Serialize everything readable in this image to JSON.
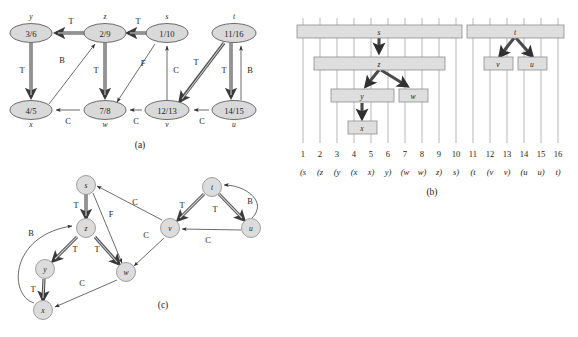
{
  "figure": {
    "captions": {
      "a": "(a)",
      "b": "(b)",
      "c": "(c)"
    }
  },
  "panel_a": {
    "caption": "(a)",
    "nodes": [
      {
        "name": "y",
        "times": "3/6",
        "label_pos": "above",
        "cx": 31,
        "cy": 33
      },
      {
        "name": "z",
        "times": "2/9",
        "label_pos": "above",
        "cx": 105,
        "cy": 33
      },
      {
        "name": "s",
        "times": "1/10",
        "label_pos": "above",
        "cx": 167,
        "cy": 33
      },
      {
        "name": "t",
        "times": "11/16",
        "label_pos": "above",
        "cx": 234,
        "cy": 33
      },
      {
        "name": "x",
        "times": "4/5",
        "label_pos": "below",
        "cx": 31,
        "cy": 110
      },
      {
        "name": "w",
        "times": "7/8",
        "label_pos": "below",
        "cx": 105,
        "cy": 110
      },
      {
        "name": "v",
        "times": "12/13",
        "label_pos": "below",
        "cx": 167,
        "cy": 110
      },
      {
        "name": "u",
        "times": "14/15",
        "label_pos": "below",
        "cx": 234,
        "cy": 110
      }
    ],
    "edges": [
      {
        "from": "z",
        "to": "y",
        "class": "T",
        "kind": "tree"
      },
      {
        "from": "s",
        "to": "z",
        "class": "T",
        "kind": "tree"
      },
      {
        "from": "y",
        "to": "x",
        "class": "T",
        "kind": "tree"
      },
      {
        "from": "z",
        "to": "w",
        "class": "T",
        "kind": "tree"
      },
      {
        "from": "x",
        "to": "z",
        "class": "B",
        "kind": "thin"
      },
      {
        "from": "s",
        "to": "w",
        "class": "F",
        "kind": "thin"
      },
      {
        "from": "v",
        "to": "s",
        "class": "C",
        "kind": "thin"
      },
      {
        "from": "t",
        "to": "v",
        "class": "T",
        "kind": "tree"
      },
      {
        "from": "t",
        "to": "u",
        "class": "T",
        "kind": "tree"
      },
      {
        "from": "u",
        "to": "t",
        "class": "B",
        "kind": "thin"
      },
      {
        "from": "w",
        "to": "x",
        "class": "C",
        "kind": "thin"
      },
      {
        "from": "v",
        "to": "w",
        "class": "C",
        "kind": "thin"
      },
      {
        "from": "u",
        "to": "v",
        "class": "C",
        "kind": "thin"
      }
    ],
    "edge_classes": {
      "T": "T",
      "B": "B",
      "F": "F",
      "C": "C"
    }
  },
  "panel_b": {
    "caption": "(b)",
    "ticks": [
      "1",
      "2",
      "3",
      "4",
      "5",
      "6",
      "7",
      "8",
      "9",
      "10",
      "11",
      "12",
      "13",
      "14",
      "15",
      "16"
    ],
    "paren_sequence": [
      "(s",
      "(z",
      "(y",
      "(x",
      "x)",
      "y)",
      "(w",
      "w)",
      "z)",
      "s)",
      "(t",
      "(v",
      "v)",
      "(u",
      "u)",
      "t)"
    ],
    "bars": [
      {
        "name": "s",
        "start": 1,
        "end": 10,
        "depth": 0
      },
      {
        "name": "z",
        "start": 2,
        "end": 9,
        "depth": 1
      },
      {
        "name": "y",
        "start": 3,
        "end": 6,
        "depth": 2
      },
      {
        "name": "x",
        "start": 4,
        "end": 5,
        "depth": 3
      },
      {
        "name": "w",
        "start": 7,
        "end": 8,
        "depth": 2
      },
      {
        "name": "t",
        "start": 11,
        "end": 16,
        "depth": 0
      },
      {
        "name": "v",
        "start": 12,
        "end": 13,
        "depth": 1
      },
      {
        "name": "u",
        "start": 14,
        "end": 15,
        "depth": 1
      }
    ],
    "tree_arrows": [
      {
        "from": "s",
        "to": "z"
      },
      {
        "from": "z",
        "to": "y"
      },
      {
        "from": "z",
        "to": "w"
      },
      {
        "from": "y",
        "to": "x"
      },
      {
        "from": "t",
        "to": "v"
      },
      {
        "from": "t",
        "to": "u"
      }
    ]
  },
  "panel_c": {
    "caption": "(c)",
    "nodes": [
      {
        "name": "s",
        "cx": 86,
        "cy": 185
      },
      {
        "name": "z",
        "cx": 86,
        "cy": 228
      },
      {
        "name": "y",
        "cx": 45,
        "cy": 269
      },
      {
        "name": "x",
        "cx": 43,
        "cy": 310
      },
      {
        "name": "w",
        "cx": 126,
        "cy": 272
      },
      {
        "name": "v",
        "cx": 170,
        "cy": 228
      },
      {
        "name": "t",
        "cx": 212,
        "cy": 187
      },
      {
        "name": "u",
        "cx": 251,
        "cy": 228
      }
    ],
    "edges": [
      {
        "from": "s",
        "to": "z",
        "class": "T",
        "kind": "tree"
      },
      {
        "from": "z",
        "to": "y",
        "class": "T",
        "kind": "tree"
      },
      {
        "from": "z",
        "to": "w",
        "class": "T",
        "kind": "tree"
      },
      {
        "from": "y",
        "to": "x",
        "class": "T",
        "kind": "tree"
      },
      {
        "from": "x",
        "to": "z",
        "class": "B",
        "kind": "thin"
      },
      {
        "from": "s",
        "to": "w",
        "class": "F",
        "kind": "thin"
      },
      {
        "from": "t",
        "to": "v",
        "class": "T",
        "kind": "tree"
      },
      {
        "from": "t",
        "to": "u",
        "class": "T",
        "kind": "tree"
      },
      {
        "from": "u",
        "to": "t",
        "class": "B",
        "kind": "thin"
      },
      {
        "from": "u",
        "to": "v",
        "class": "C",
        "kind": "thin"
      },
      {
        "from": "v",
        "to": "s",
        "class": "C",
        "kind": "thin"
      },
      {
        "from": "v",
        "to": "w",
        "class": "C",
        "kind": "thin"
      },
      {
        "from": "w",
        "to": "x",
        "class": "C",
        "kind": "thin"
      }
    ]
  }
}
